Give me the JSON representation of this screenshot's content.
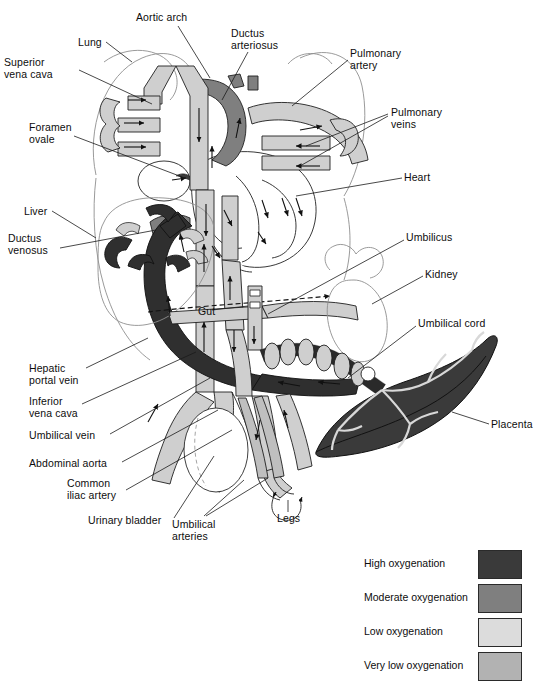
{
  "diagram": {
    "background": "#ffffff"
  },
  "labels": [
    {
      "id": "lung",
      "text": "Lung",
      "x": 78,
      "y": 37,
      "align": "left"
    },
    {
      "id": "aortic-arch",
      "text": "Aortic arch",
      "x": 136,
      "y": 12,
      "align": "left"
    },
    {
      "id": "ductus-arteriosus",
      "text": "Ductus\narteriosus",
      "x": 231,
      "y": 28,
      "align": "left"
    },
    {
      "id": "superior-vena-cava",
      "text": "Superior\nvena cava",
      "x": 4,
      "y": 57,
      "align": "left"
    },
    {
      "id": "pulmonary-artery",
      "text": "Pulmonary\nartery",
      "x": 350,
      "y": 48,
      "align": "left"
    },
    {
      "id": "pulmonary-veins",
      "text": "Pulmonary\nveins",
      "x": 391,
      "y": 107,
      "align": "left"
    },
    {
      "id": "foramen-ovale",
      "text": "Foramen\novale",
      "x": 29,
      "y": 122,
      "align": "left"
    },
    {
      "id": "heart",
      "text": "Heart",
      "x": 404,
      "y": 172,
      "align": "left"
    },
    {
      "id": "liver",
      "text": "Liver",
      "x": 24,
      "y": 206,
      "align": "left"
    },
    {
      "id": "ductus-venosus",
      "text": "Ductus\nvenosus",
      "x": 8,
      "y": 233,
      "align": "left"
    },
    {
      "id": "umbilicus",
      "text": "Umbilicus",
      "x": 406,
      "y": 232,
      "align": "left"
    },
    {
      "id": "kidney",
      "text": "Kidney",
      "x": 425,
      "y": 269,
      "align": "left"
    },
    {
      "id": "gut",
      "text": "Gut",
      "x": 198,
      "y": 306,
      "align": "left"
    },
    {
      "id": "umbilical-cord",
      "text": "Umbilical cord",
      "x": 418,
      "y": 318,
      "align": "left"
    },
    {
      "id": "hepatic-portal-vein",
      "text": "Hepatic\nportal vein",
      "x": 29,
      "y": 363,
      "align": "left"
    },
    {
      "id": "inferior-vena-cava",
      "text": "Inferior\nvena cava",
      "x": 29,
      "y": 396,
      "align": "left"
    },
    {
      "id": "placenta",
      "text": "Placenta",
      "x": 491,
      "y": 419,
      "align": "left"
    },
    {
      "id": "umbilical-vein",
      "text": "Umbilical vein",
      "x": 29,
      "y": 430,
      "align": "left"
    },
    {
      "id": "abdominal-aorta",
      "text": "Abdominal aorta",
      "x": 29,
      "y": 458,
      "align": "left"
    },
    {
      "id": "common-iliac-artery",
      "text": "Common\niliac artery",
      "x": 67,
      "y": 478,
      "align": "left"
    },
    {
      "id": "urinary-bladder",
      "text": "Urinary bladder",
      "x": 88,
      "y": 515,
      "align": "left"
    },
    {
      "id": "umbilical-arteries",
      "text": "Umbilical\narteries",
      "x": 172,
      "y": 519,
      "align": "left"
    },
    {
      "id": "legs",
      "text": "Legs",
      "x": 277,
      "y": 513,
      "align": "left"
    }
  ],
  "legend": {
    "items": [
      {
        "label": "High oxygenation",
        "color": "#3a3a3a"
      },
      {
        "label": "Moderate oxygenation",
        "color": "#7f7f7f"
      },
      {
        "label": "Low oxygenation",
        "color": "#dcdcdc"
      },
      {
        "label": "Very low oxygenation",
        "color": "#b2b2b2"
      }
    ]
  },
  "palette": {
    "high_oxygenation": "#3a3a3a",
    "moderate_oxygenation": "#7f7f7f",
    "low_oxygenation": "#dcdcdc",
    "very_low_oxygenation": "#b2b2b2",
    "outline": "#1a1a1a",
    "leader_line": "#1a1a1a",
    "body_outline": "#8a8a8a"
  }
}
